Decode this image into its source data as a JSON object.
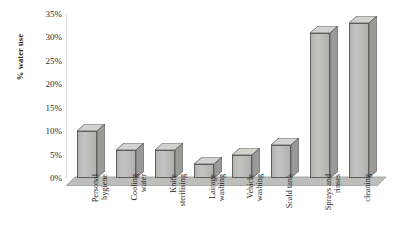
{
  "chart_data": {
    "type": "bar",
    "title": "",
    "xlabel": "",
    "ylabel": "% water use",
    "ylim": [
      0,
      35
    ],
    "ytick_labels": [
      "35%",
      "30%",
      "25%",
      "20%",
      "15%",
      "10%",
      "5%",
      "0%"
    ],
    "ytick_values": [
      35,
      30,
      25,
      20,
      15,
      10,
      5,
      0
    ],
    "grid": false,
    "legend": "none",
    "style": "3d-column",
    "bar_color": "#bdbdb9",
    "bar_edge_color": "#5d5d5a",
    "categories": [
      "Personal hygiene",
      "Cooling water",
      "Knife sterilising",
      "Lairage washing",
      "Vehicle washing",
      "Scald tank",
      "Sprays and rinses",
      "cleaning"
    ],
    "category_lines": [
      [
        "Personal",
        "hygiene"
      ],
      [
        "Cooling",
        "water"
      ],
      [
        "Knife",
        "sterilising"
      ],
      [
        "Lairage",
        "washing"
      ],
      [
        "Vehicle",
        "washing"
      ],
      [
        "Scald tank",
        ""
      ],
      [
        "Sprays and",
        "rinses"
      ],
      [
        "cleaning",
        ""
      ]
    ],
    "values": [
      10,
      6,
      6,
      3,
      5,
      7,
      31,
      33
    ]
  }
}
